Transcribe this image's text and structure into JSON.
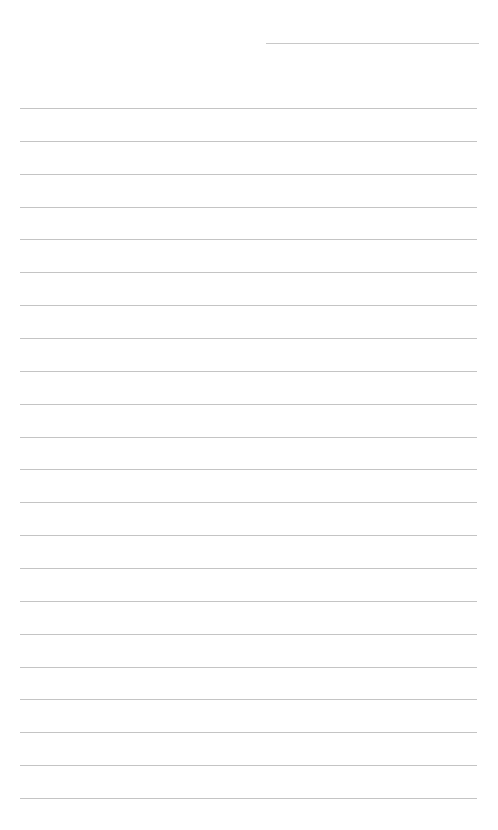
{
  "page": {
    "type": "lined-paper",
    "header_line": {
      "x": 266,
      "y": 43,
      "width": 213
    },
    "lines": {
      "count": 22,
      "start_y": 108,
      "spacing": 32.86,
      "x": 20,
      "width": 457
    },
    "line_color": "#c4c4c4",
    "background": "#ffffff"
  }
}
